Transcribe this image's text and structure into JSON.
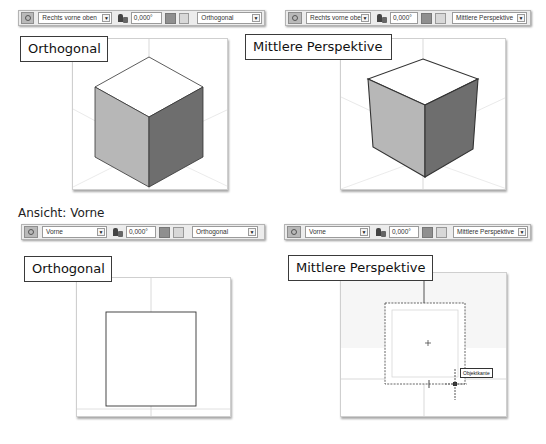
{
  "panels": [
    {
      "id": "top-left",
      "toolbar": {
        "view": "Rechts vorne oben",
        "angle": "0,000°",
        "projection": "Orthogonal"
      },
      "label": "Orthogonal"
    },
    {
      "id": "top-right",
      "toolbar": {
        "view": "Rechts vorne oben",
        "angle": "0,000°",
        "projection": "Mittlere Perspektive"
      },
      "label": "Mittlere Perspektive"
    },
    {
      "id": "bottom-left",
      "toolbar": {
        "view": "Vorne",
        "angle": "0,000°",
        "projection": "Orthogonal"
      },
      "label": "Orthogonal"
    },
    {
      "id": "bottom-right",
      "toolbar": {
        "view": "Vorne",
        "angle": "0,000°",
        "projection": "Mittlere Perspektive"
      },
      "label": "Mittlere Perspektive",
      "tooltip": "Objektkante"
    }
  ],
  "section_heading": "Ansicht: Vorne",
  "icons": {
    "view_cube": "view-cube-icon",
    "angle": "rotation-angle-icon",
    "toggle_1": "display-mode-icon",
    "toggle_2": "grid-icon",
    "dropdown": "▼"
  },
  "colors": {
    "cube_top": "#ffffff",
    "cube_left": "#b7b7b7",
    "cube_right": "#6e6e6e",
    "edge": "#333333",
    "axis": "#cccccc",
    "toolbar_bg": "#ececec"
  }
}
